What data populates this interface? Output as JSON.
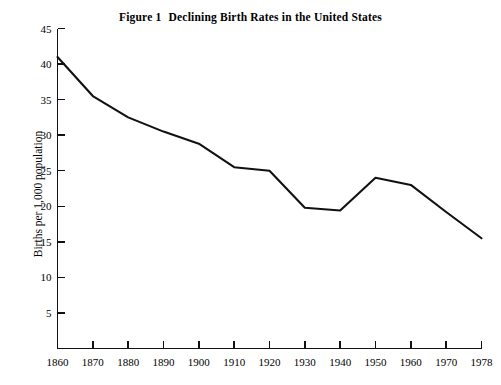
{
  "chart_data": {
    "type": "line",
    "title_figure_number": "Figure 1",
    "title_text": "Declining Birth Rates in the United States",
    "xlabel": "",
    "ylabel": "Births per 1,000 population",
    "xlim": [
      1860,
      1978
    ],
    "ylim": [
      0,
      45
    ],
    "grid": false,
    "legend": false,
    "x": [
      1860,
      1870,
      1880,
      1890,
      1900,
      1910,
      1920,
      1930,
      1940,
      1950,
      1960,
      1970,
      1978
    ],
    "values": [
      41.0,
      35.5,
      32.5,
      30.5,
      28.8,
      25.5,
      25.0,
      19.8,
      19.4,
      24.0,
      23.0,
      19.2,
      15.5
    ],
    "series": [
      {
        "name": "Births per 1,000 population",
        "values": [
          41.0,
          35.5,
          32.5,
          30.5,
          28.8,
          25.5,
          25.0,
          19.8,
          19.4,
          24.0,
          23.0,
          19.2,
          15.5
        ]
      }
    ],
    "xticks": [
      "1860",
      "1870",
      "1880",
      "1890",
      "1900",
      "1910",
      "1920",
      "1930",
      "1940",
      "1950",
      "1960",
      "1970",
      "1978"
    ],
    "yticks": [
      "5",
      "10",
      "15",
      "20",
      "25",
      "30",
      "35",
      "40",
      "45"
    ],
    "ytick_values": [
      5,
      10,
      15,
      20,
      25,
      30,
      35,
      40,
      45
    ],
    "line_color": "#111111"
  }
}
